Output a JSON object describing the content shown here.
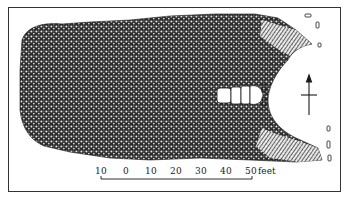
{
  "figure": {
    "type": "archaeological site plan",
    "colors": {
      "ink": "#1a1a1a",
      "paper": "#ffffff",
      "stone_fill": "#3a3a3a"
    }
  },
  "north_arrow": {
    "icon": "north-arrow-icon"
  },
  "scale_bar": {
    "ticks": [
      "10",
      "0",
      "10",
      "20",
      "30",
      "40",
      "50"
    ],
    "unit": "feet",
    "unit_label": "feet"
  }
}
